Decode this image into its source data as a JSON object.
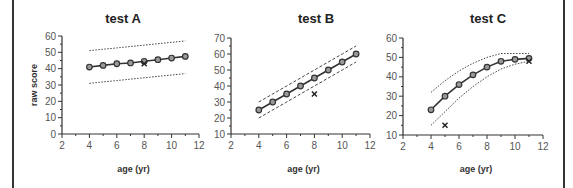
{
  "chart_data": [
    {
      "type": "line",
      "title": "test  A",
      "xlabel": "age  (yr)",
      "ylabel": "raw  score",
      "xlim": [
        2,
        12
      ],
      "ylim": [
        0,
        60
      ],
      "xticks": [
        2,
        4,
        6,
        8,
        10,
        12
      ],
      "yticks": [
        0,
        10,
        20,
        30,
        40,
        50,
        60
      ],
      "grid": false,
      "x": [
        4,
        5,
        6,
        7,
        8,
        9,
        10,
        11
      ],
      "series": [
        {
          "name": "mean",
          "style": "solid-circle",
          "values": [
            41,
            42,
            43,
            43.5,
            44.5,
            45.5,
            46.5,
            47.5
          ]
        },
        {
          "name": "upper bound",
          "style": "dotted",
          "values": [
            51,
            51.9,
            52.7,
            53.6,
            54.4,
            55.3,
            56.1,
            57
          ]
        },
        {
          "name": "lower bound",
          "style": "dotted",
          "values": [
            31,
            31.9,
            32.7,
            33.6,
            34.4,
            35.3,
            36.1,
            37
          ]
        }
      ],
      "markers": [
        {
          "label": "x",
          "x": 8,
          "y": 43
        }
      ]
    },
    {
      "type": "line",
      "title": "test  B",
      "xlabel": "age  (yr)",
      "ylabel": "",
      "xlim": [
        2,
        12
      ],
      "ylim": [
        10,
        70
      ],
      "xticks": [
        2,
        4,
        6,
        8,
        10,
        12
      ],
      "yticks": [
        10,
        20,
        30,
        40,
        50,
        60,
        70
      ],
      "grid": false,
      "x": [
        4,
        5,
        6,
        7,
        8,
        9,
        10,
        11
      ],
      "series": [
        {
          "name": "mean",
          "style": "solid-circle",
          "values": [
            25,
            30,
            35,
            40,
            45,
            50,
            55,
            60
          ]
        },
        {
          "name": "upper bound",
          "style": "dashed",
          "values": [
            30,
            35,
            40,
            45,
            50,
            55,
            60,
            65
          ]
        },
        {
          "name": "lower bound",
          "style": "dashed",
          "values": [
            20,
            25,
            30,
            35,
            40,
            45,
            50,
            55
          ]
        }
      ],
      "markers": [
        {
          "label": "x",
          "x": 8,
          "y": 35
        }
      ]
    },
    {
      "type": "line",
      "title": "test  C",
      "xlabel": "age  (yr)",
      "ylabel": "",
      "xlim": [
        2,
        12
      ],
      "ylim": [
        10,
        60
      ],
      "xticks": [
        2,
        4,
        6,
        8,
        10,
        12
      ],
      "yticks": [
        10,
        20,
        30,
        40,
        50,
        60
      ],
      "grid": false,
      "x": [
        4,
        5,
        6,
        7,
        8,
        9,
        10,
        11
      ],
      "series": [
        {
          "name": "mean",
          "style": "solid-circle",
          "values": [
            23,
            30,
            36,
            41,
            45,
            48,
            49,
            49.5
          ]
        },
        {
          "name": "upper bound",
          "style": "dotted",
          "values": [
            32,
            38,
            43,
            47,
            50,
            52,
            52,
            52
          ]
        },
        {
          "name": "lower bound",
          "style": "dotted",
          "values": [
            15,
            22,
            29,
            35,
            40,
            44,
            46.5,
            48
          ]
        }
      ],
      "markers": [
        {
          "label": "x",
          "x": 5,
          "y": 15
        },
        {
          "label": "x",
          "x": 11,
          "y": 48
        }
      ]
    }
  ]
}
